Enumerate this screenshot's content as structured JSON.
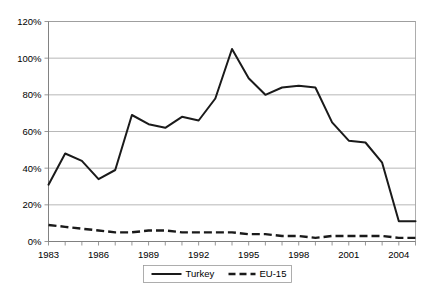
{
  "chart_data": {
    "type": "line",
    "title": "",
    "xlabel": "",
    "ylabel": "",
    "ylim": [
      0,
      120
    ],
    "xlim": [
      1983,
      2005
    ],
    "grid": true,
    "legend_position": "bottom",
    "y_ticks": [
      "0%",
      "20%",
      "40%",
      "60%",
      "80%",
      "100%",
      "120%"
    ],
    "y_tick_values": [
      0,
      20,
      40,
      60,
      80,
      100,
      120
    ],
    "x": [
      1983,
      1984,
      1985,
      1986,
      1987,
      1988,
      1989,
      1990,
      1991,
      1992,
      1993,
      1994,
      1995,
      1996,
      1997,
      1998,
      1999,
      2000,
      2001,
      2002,
      2003,
      2004,
      2005
    ],
    "x_tick_labels": [
      "1983",
      "1986",
      "1989",
      "1992",
      "1995",
      "1998",
      "2001",
      "2004"
    ],
    "x_tick_label_values": [
      1983,
      1986,
      1989,
      1992,
      1995,
      1998,
      2001,
      2004
    ],
    "series": [
      {
        "name": "Turkey",
        "style": "solid",
        "color": "#1a1a1a",
        "values": [
          31,
          48,
          44,
          34,
          39,
          69,
          64,
          62,
          68,
          66,
          78,
          105,
          89,
          80,
          84,
          85,
          84,
          65,
          55,
          54,
          43,
          11,
          11
        ]
      },
      {
        "name": "EU-15",
        "style": "dashed",
        "color": "#1a1a1a",
        "values": [
          9,
          8,
          7,
          6,
          5,
          5,
          6,
          6,
          5,
          5,
          5,
          5,
          4,
          4,
          3,
          3,
          2,
          3,
          3,
          3,
          3,
          2,
          2
        ]
      }
    ]
  },
  "legend": {
    "items": [
      {
        "label": "Turkey",
        "style": "solid"
      },
      {
        "label": "EU-15",
        "style": "dashed"
      }
    ]
  }
}
